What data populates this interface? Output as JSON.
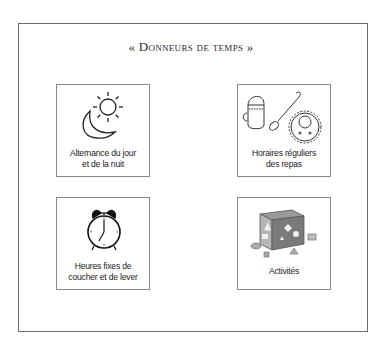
{
  "title": "« Donneurs de temps »",
  "cards": [
    {
      "id": "day-night",
      "label_line1": "Alternance du jour",
      "label_line2": "et de la nuit",
      "icon": "sun-moon-icon"
    },
    {
      "id": "meals",
      "label_line1": "Horaires réguliers",
      "label_line2": "des repas",
      "icon": "cup-spoon-bib-icon"
    },
    {
      "id": "sleep",
      "label_line1": "Heures fixes de",
      "label_line2": "coucher et de lever",
      "icon": "alarm-clock-icon"
    },
    {
      "id": "activities",
      "label_line1": "Activités",
      "label_line2": "",
      "icon": "shape-sorter-cube-icon"
    }
  ]
}
